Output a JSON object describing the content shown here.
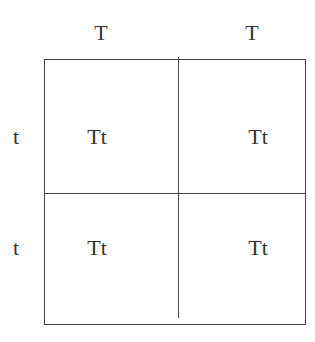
{
  "diagram": {
    "type": "punnett-square",
    "column_alleles": [
      "T",
      "T"
    ],
    "row_alleles": [
      "t",
      "t"
    ],
    "cells": [
      [
        "Tt",
        "Tt"
      ],
      [
        "Tt",
        "Tt"
      ]
    ],
    "colors": {
      "text": "#333333",
      "lines": "#444444",
      "background": "#ffffff"
    }
  }
}
